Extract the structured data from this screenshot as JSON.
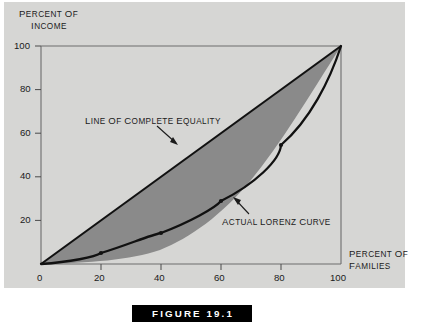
{
  "figure": {
    "caption": "FIGURE 19.1"
  },
  "axes": {
    "y_title_line1": "PERCENT OF",
    "y_title_line2": "INCOME",
    "x_title_line1": "PERCENT OF",
    "x_title_line2": "FAMILIES",
    "y_ticks": [
      "100",
      "80",
      "60",
      "40",
      "20"
    ],
    "x_ticks": [
      "0",
      "20",
      "40",
      "60",
      "80",
      "100"
    ],
    "origin_label": "0"
  },
  "annotations": {
    "equality": "LINE OF COMPLETE EQUALITY",
    "lorenz": "ACTUAL LORENZ CURVE"
  },
  "colors": {
    "panel_background": "#d6d6d4",
    "shaded_area": "#8a8a8a",
    "curve": "#111111",
    "axis": "#4a4a4a",
    "text": "#1b1b1b",
    "caption_bar": "#000000",
    "caption_text": "#ffffff"
  },
  "chart_data": {
    "type": "line",
    "title": "FIGURE 19.1",
    "xlabel": "PERCENT OF FAMILIES",
    "ylabel": "PERCENT OF INCOME",
    "xlim": [
      0,
      100
    ],
    "ylim": [
      0,
      100
    ],
    "grid": false,
    "legend_position": "none",
    "xticks": [
      0,
      20,
      40,
      60,
      80,
      100
    ],
    "yticks": [
      0,
      20,
      40,
      60,
      80,
      100
    ],
    "series": [
      {
        "name": "Line of complete equality",
        "x": [
          0,
          100
        ],
        "values": [
          0,
          100
        ],
        "markers": false
      },
      {
        "name": "Actual Lorenz curve",
        "x": [
          0,
          20,
          40,
          60,
          80,
          100
        ],
        "values": [
          0,
          5,
          14,
          29,
          54.5,
          100
        ],
        "markers": true
      }
    ],
    "shaded_region": {
      "name": "Area of income inequality",
      "between": [
        "Line of complete equality",
        "Actual Lorenz curve"
      ],
      "color": "#8a8a8a"
    },
    "annotations": [
      {
        "text": "LINE OF COMPLETE EQUALITY",
        "points_to": [
          44,
          47
        ]
      },
      {
        "text": "ACTUAL LORENZ CURVE",
        "points_to": [
          62,
          31
        ]
      }
    ]
  }
}
